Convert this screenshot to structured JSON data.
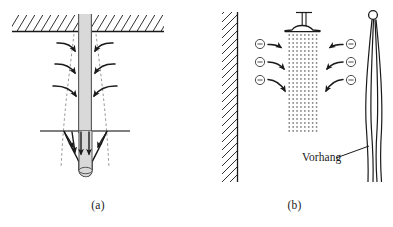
{
  "figure": {
    "background_color": "#ffffff",
    "stroke_color": "#1a1a1a",
    "water_fill_color": "#d9d9d9",
    "dash_color": "#8c8c8c",
    "width": 393,
    "height": 227
  },
  "panel_a": {
    "caption": "(a)",
    "description": "Plunging water jet from ceiling entraining air into a pool cavity",
    "elements": {
      "ceiling_label": "hatched-ceiling",
      "jet_label": "falling-water-column",
      "pool_surface_label": "water-surface-line",
      "cavity_label": "entrained-air-cavity",
      "entrainment_boundary_label": "dashed-entrainment-boundary"
    },
    "inflow_arrow_count_per_side": 3,
    "downward_arrow_count": 3
  },
  "panel_b": {
    "caption": "(b)",
    "curtain_label": "Vorhang",
    "description": "Shower spray entraining air, drawing the curtain inward",
    "elements": {
      "wall_label": "hatched-wall",
      "shower_label": "shower-head",
      "spray_label": "water-droplet-spray",
      "curtain_label": "shower-curtain",
      "ring_label": "curtain-ring"
    },
    "pressure_symbol": "⊖",
    "pressure_symbol_count_per_side": 3,
    "pressure_symbol_meaning": "low-pressure"
  }
}
